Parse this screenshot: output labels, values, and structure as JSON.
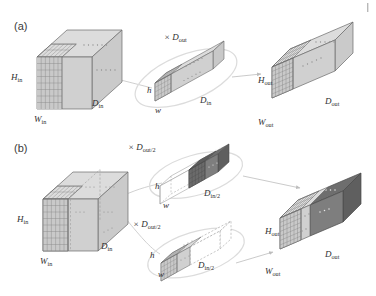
{
  "figure": {
    "type": "diagram",
    "background": "#ffffff",
    "corner_mark": "|"
  },
  "panels": [
    {
      "id": "a",
      "label": "(a)",
      "label_pos": {
        "x": 14,
        "y": 30
      },
      "description": "standard convolution",
      "blocks": [
        {
          "name": "input-tensor",
          "labels": [
            {
              "text": "H",
              "sub": "in",
              "x": 11,
              "y": 80
            },
            {
              "text": "W",
              "sub": "in",
              "x": 34,
              "y": 122
            },
            {
              "text": "D",
              "sub": "in",
              "x": 92,
              "y": 106
            }
          ]
        },
        {
          "name": "kernel-tensor",
          "labels": [
            {
              "text": "h",
              "sub": "",
              "x": 147,
              "y": 93
            },
            {
              "text": "w",
              "sub": "",
              "x": 155,
              "y": 113
            },
            {
              "text": "D",
              "sub": "in",
              "x": 200,
              "y": 103
            }
          ],
          "multiplier": {
            "text": "× D",
            "sub": "out",
            "x": 164,
            "y": 40
          }
        },
        {
          "name": "output-tensor",
          "labels": [
            {
              "text": "H",
              "sub": "out",
              "x": 258,
              "y": 83
            },
            {
              "text": "W",
              "sub": "out",
              "x": 258,
              "y": 125
            },
            {
              "text": "D",
              "sub": "out",
              "x": 325,
              "y": 104
            }
          ]
        }
      ]
    },
    {
      "id": "b",
      "label": "(b)",
      "label_pos": {
        "x": 14,
        "y": 152
      },
      "description": "grouped convolution with two groups",
      "blocks": [
        {
          "name": "input-tensor",
          "labels": [
            {
              "text": "H",
              "sub": "in",
              "x": 17,
              "y": 222
            },
            {
              "text": "W",
              "sub": "in",
              "x": 40,
              "y": 264
            },
            {
              "text": "D",
              "sub": "in",
              "x": 101,
              "y": 249
            }
          ]
        },
        {
          "name": "kernel-group-1",
          "labels": [
            {
              "text": "h",
              "sub": "",
              "x": 155,
              "y": 189
            },
            {
              "text": "w",
              "sub": "",
              "x": 163,
              "y": 208
            },
            {
              "text": "D",
              "sub": "in/2",
              "x": 204,
              "y": 196
            }
          ],
          "multiplier": {
            "text": "× D",
            "sub": "out/2",
            "x": 128,
            "y": 150
          }
        },
        {
          "name": "kernel-group-2",
          "labels": [
            {
              "text": "h",
              "sub": "",
              "x": 150,
              "y": 258
            },
            {
              "text": "w",
              "sub": "",
              "x": 158,
              "y": 277
            },
            {
              "text": "D",
              "sub": "in/2",
              "x": 198,
              "y": 268
            }
          ],
          "multiplier": {
            "text": "× D",
            "sub": "out/2",
            "x": 133,
            "y": 227
          }
        },
        {
          "name": "output-tensor",
          "labels": [
            {
              "text": "H",
              "sub": "out",
              "x": 265,
              "y": 234
            },
            {
              "text": "W",
              "sub": "out",
              "x": 265,
              "y": 274
            },
            {
              "text": "D",
              "sub": "out",
              "x": 325,
              "y": 257
            }
          ]
        }
      ]
    }
  ],
  "colors": {
    "face_light_front": "#d0d0d0",
    "face_light_top": "#dcdcdc",
    "face_light_side": "#cfcfcf",
    "face_dark_front": "#7e7e7e",
    "face_dark_top": "#6e6e6e",
    "face_dark_side": "#5f5f5f",
    "grid_line": "#8a8a8a",
    "outline": "#5a5a5a",
    "ellipse_stroke": "#d6d6d6",
    "arrow": "#bdbdbd",
    "dots": "#8f8f8f",
    "dots_on_dark": "#e8e8e8",
    "text": "#2e2e2e",
    "empty_fill": "#ffffff",
    "dashed_stroke": "#9a9a9a"
  },
  "legend_notes": {
    "panel_a_note": "one kernel spans full input depth D_in, repeated D_out times",
    "panel_b_note": "each kernel spans half the input depth D_in/2, repeated D_out/2 times per group"
  }
}
